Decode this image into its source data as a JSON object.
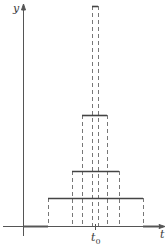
{
  "diagram": {
    "title": "",
    "axes": {
      "x_label": "t",
      "y_label": "y",
      "center_tick_label": "t",
      "center_tick_subscript": "0"
    },
    "colors": {
      "axis": "#555555",
      "pulse": "#444444",
      "dashed": "#777777",
      "background": "#ffffff"
    },
    "pulses": [
      {
        "name": "widest",
        "x0": 48,
        "x1": 143,
        "top": 198
      },
      {
        "name": "second",
        "x0": 72,
        "x1": 119,
        "top": 171
      },
      {
        "name": "third",
        "x0": 82,
        "x1": 107,
        "top": 115
      },
      {
        "name": "narrowest",
        "x0": 92,
        "x1": 98,
        "top": 6
      }
    ]
  }
}
